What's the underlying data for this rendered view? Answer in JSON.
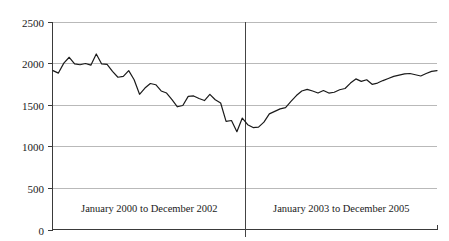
{
  "chart_data": {
    "type": "line",
    "title": "",
    "subtitle": "",
    "xlabel": "",
    "ylabel": "",
    "ylim": [
      0,
      2500
    ],
    "yticks": [
      0,
      500,
      1000,
      1500,
      2000,
      2500
    ],
    "ytick_labels": [
      "0",
      "500",
      "1000",
      "1500",
      "2000",
      "2500"
    ],
    "grid": true,
    "legend": "none",
    "annotations": [
      {
        "text": "January 2000 to December 2002",
        "position": "below-axis-left-half"
      },
      {
        "text": "January 2003 to December 2005",
        "position": "below-axis-right-half"
      }
    ],
    "divider": {
      "after_index": 35,
      "label": "period split between December 2002 and January 2003"
    },
    "x": [
      "Jan 2000",
      "Feb 2000",
      "Mar 2000",
      "Apr 2000",
      "May 2000",
      "Jun 2000",
      "Jul 2000",
      "Aug 2000",
      "Sep 2000",
      "Oct 2000",
      "Nov 2000",
      "Dec 2000",
      "Jan 2001",
      "Feb 2001",
      "Mar 2001",
      "Apr 2001",
      "May 2001",
      "Jun 2001",
      "Jul 2001",
      "Aug 2001",
      "Sep 2001",
      "Oct 2001",
      "Nov 2001",
      "Dec 2001",
      "Jan 2002",
      "Feb 2002",
      "Mar 2002",
      "Apr 2002",
      "May 2002",
      "Jun 2002",
      "Jul 2002",
      "Aug 2002",
      "Sep 2002",
      "Oct 2002",
      "Nov 2002",
      "Dec 2002",
      "Jan 2003",
      "Feb 2003",
      "Mar 2003",
      "Apr 2003",
      "May 2003",
      "Jun 2003",
      "Jul 2003",
      "Aug 2003",
      "Sep 2003",
      "Oct 2003",
      "Nov 2003",
      "Dec 2003",
      "Jan 2004",
      "Feb 2004",
      "Mar 2004",
      "Apr 2004",
      "May 2004",
      "Jun 2004",
      "Jul 2004",
      "Aug 2004",
      "Sep 2004",
      "Oct 2004",
      "Nov 2004",
      "Dec 2004",
      "Jan 2005",
      "Feb 2005",
      "Mar 2005",
      "Apr 2005",
      "May 2005",
      "Jun 2005",
      "Jul 2005",
      "Aug 2005",
      "Sep 2005",
      "Oct 2005",
      "Nov 2005",
      "Dec 2005"
    ],
    "values": [
      1910,
      1880,
      2000,
      2070,
      1990,
      1980,
      1995,
      1975,
      2110,
      1990,
      1985,
      1900,
      1830,
      1840,
      1910,
      1800,
      1625,
      1700,
      1755,
      1740,
      1665,
      1640,
      1560,
      1475,
      1490,
      1600,
      1605,
      1575,
      1550,
      1625,
      1560,
      1520,
      1300,
      1310,
      1175,
      1340,
      1260,
      1225,
      1230,
      1290,
      1390,
      1420,
      1450,
      1465,
      1540,
      1610,
      1665,
      1685,
      1665,
      1640,
      1670,
      1640,
      1650,
      1680,
      1695,
      1760,
      1810,
      1780,
      1800,
      1745,
      1760,
      1790,
      1815,
      1840,
      1855,
      1870,
      1875,
      1860,
      1845,
      1875,
      1900,
      1910
    ]
  },
  "period_labels": {
    "left": "January 2000 to December 2002",
    "right": "January 2003 to December 2005"
  }
}
